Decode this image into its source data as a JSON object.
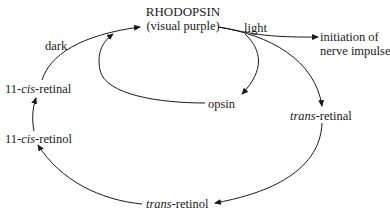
{
  "diagram": {
    "type": "cycle",
    "nodes": {
      "rhodopsin": {
        "name": "RHODOPSIN",
        "subtitle": "(visual purple)"
      },
      "light": {
        "label": "light"
      },
      "nerve_impulse": {
        "line1": "initiation of",
        "line2": "nerve impulse"
      },
      "opsin": {
        "label": "opsin"
      },
      "trans_retinal": {
        "prefix": "trans",
        "suffix": "-retinal"
      },
      "trans_retinol": {
        "prefix": "trans",
        "suffix": "-retinol"
      },
      "cis_retinol": {
        "prefix": "11-",
        "italic": "cis",
        "suffix": "-retinol"
      },
      "cis_retinal": {
        "prefix": "11-",
        "italic": "cis",
        "suffix": "-retinal"
      },
      "dark": {
        "label": "dark"
      }
    },
    "edges": [
      {
        "from": "RHODOPSIN",
        "to": "initiation of nerve impulse",
        "label": "light"
      },
      {
        "from": "RHODOPSIN",
        "to": "opsin",
        "label": "light"
      },
      {
        "from": "RHODOPSIN",
        "to": "trans-retinal",
        "label": "light"
      },
      {
        "from": "trans-retinal",
        "to": "trans-retinol"
      },
      {
        "from": "trans-retinol",
        "to": "11-cis-retinol"
      },
      {
        "from": "11-cis-retinol",
        "to": "11-cis-retinal"
      },
      {
        "from": "11-cis-retinal",
        "to": "RHODOPSIN",
        "label": "dark"
      },
      {
        "from": "opsin",
        "to": "RHODOPSIN"
      }
    ],
    "colors": {
      "ink": "#1a1a1a",
      "background": "#ffffff"
    }
  }
}
